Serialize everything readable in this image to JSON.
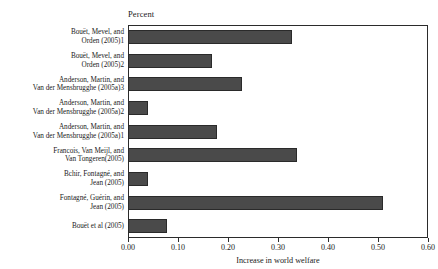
{
  "chart_data": {
    "type": "bar",
    "orientation": "horizontal",
    "title": "",
    "subtitle": "",
    "unit_caption": "Percent",
    "xlabel": "Increase in world welfare",
    "ylabel": "",
    "xlim": [
      0.0,
      0.6
    ],
    "xticks": [
      0.0,
      0.1,
      0.2,
      0.3,
      0.4,
      0.5,
      0.6
    ],
    "xtick_labels": [
      "0.00",
      "0.10",
      "0.20",
      "0.30",
      "0.40",
      "0.50",
      "0.60"
    ],
    "grid": false,
    "legend": false,
    "bar_color": "#4a4a4a",
    "bar_edge_color": "#2a2a2a",
    "axis_color": "#2b2b2b",
    "categories": [
      "Bouët, Mevel, and\nOrden (2005)1",
      "Bouët, Mevel, and\nOrden (2005)2",
      "Anderson, Martin, and\nVan der Mensbrugghe (2005a)3",
      "Anderson, Martin, and\nVan der Mensbrugghe (2005a)2",
      "Anderson, Martin, and\nVan der Mensbrugghe (2005a)1",
      "Francois, Van Meijl, and\nVan Tongeren(2005)",
      "Bchir, Fontagné, and\nJean (2005)",
      "Fontagné, Guérin, and\nJean (2005)",
      "Bouët et al (2005)"
    ],
    "values": [
      0.328,
      0.168,
      0.228,
      0.04,
      0.178,
      0.338,
      0.04,
      0.51,
      0.078
    ]
  }
}
